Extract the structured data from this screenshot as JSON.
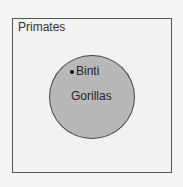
{
  "diagram": {
    "type": "euler",
    "outer_set": {
      "label": "Primates",
      "fill": "#f2f2f0",
      "stroke": "#555555"
    },
    "inner_set": {
      "label": "Gorillas",
      "fill": "#b8b8b8",
      "stroke": "#444444"
    },
    "element": {
      "label": "Binti",
      "marker": "dot"
    }
  }
}
